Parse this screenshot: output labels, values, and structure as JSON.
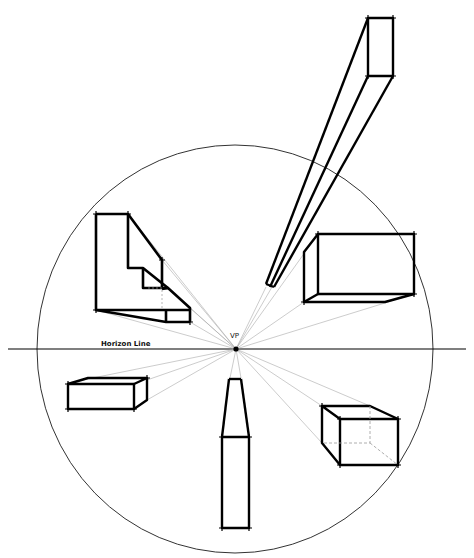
{
  "diagram": {
    "labels": {
      "horizon": "Horizon Line",
      "vanishing_point": "VP"
    },
    "colors": {
      "ink": "#000000",
      "guide": "#aaaaaa",
      "circle": "#333333",
      "background": "#ffffff"
    },
    "vanishing_point": {
      "x": 236,
      "y": 349
    },
    "horizon_line": {
      "x1": 8,
      "x2": 466,
      "y": 349
    },
    "circle": {
      "cx": 235,
      "cy": 349,
      "rx": 198,
      "ry": 204
    },
    "objects": [
      {
        "name": "stair-block",
        "position": "upper-left"
      },
      {
        "name": "tall-beam",
        "position": "upper-right"
      },
      {
        "name": "wide-box",
        "position": "right"
      },
      {
        "name": "flat-box",
        "position": "left"
      },
      {
        "name": "vertical-pillar",
        "position": "bottom"
      },
      {
        "name": "cube",
        "position": "lower-right"
      }
    ]
  }
}
